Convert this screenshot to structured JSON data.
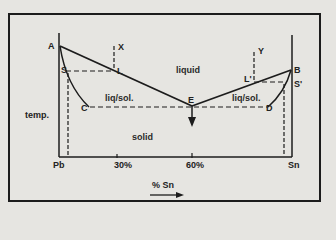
{
  "diagram": {
    "type": "phase-diagram",
    "y_axis_label": "temp.",
    "x_axis_label": "% Sn",
    "x_axis_left": "Pb",
    "x_axis_right": "Sn",
    "x_ticks": [
      "30%",
      "60%"
    ],
    "regions": {
      "liquid": "liquid",
      "liq_sol_left": "liq/sol.",
      "liq_sol_right": "liq/sol.",
      "solid": "solid"
    },
    "points": {
      "A": "A",
      "B": "B",
      "C": "C",
      "D": "D",
      "E": "E",
      "S": "S",
      "S_prime": "S'",
      "L": "L",
      "L_prime": "L'",
      "X": "X",
      "Y": "Y"
    },
    "colors": {
      "line": "#1c1c1c",
      "background": "#e6e5e1"
    }
  }
}
